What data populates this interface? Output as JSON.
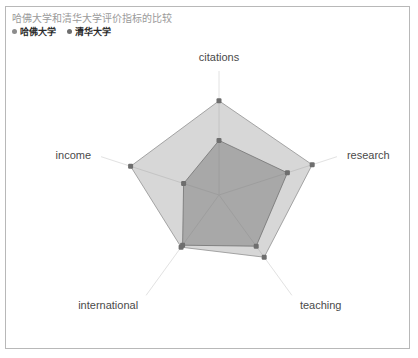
{
  "chart": {
    "title": "哈佛大学和清华大学评价指标的比较",
    "legend": [
      {
        "label": "哈佛大学",
        "color": "#8c8c8c"
      },
      {
        "label": "清华大学",
        "color": "#6e6e6e"
      }
    ]
  },
  "axis_labels": {
    "citations": "citations",
    "research": "research",
    "teaching": "teaching",
    "international": "international",
    "income": "income"
  },
  "chart_data": {
    "type": "radar",
    "title": "哈佛大学和清华大学评价指标的比较",
    "categories": [
      "citations",
      "research",
      "teaching",
      "international",
      "income"
    ],
    "rlim": [
      0,
      100
    ],
    "grid": false,
    "legend_position": "top-left",
    "series": [
      {
        "name": "哈佛大学",
        "color": "#8c8c8c",
        "fill_opacity": 0.35,
        "values": [
          76,
          79,
          62,
          52,
          75
        ]
      },
      {
        "name": "清华大学",
        "color": "#6e6e6e",
        "fill_opacity": 0.45,
        "values": [
          44,
          58,
          51,
          50,
          30
        ]
      }
    ]
  }
}
